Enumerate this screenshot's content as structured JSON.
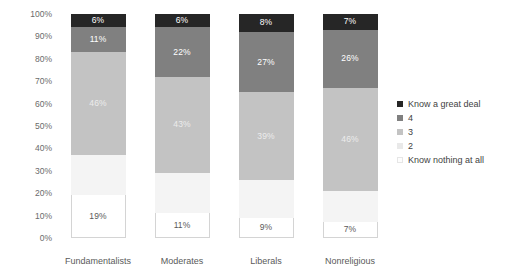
{
  "chart_data": {
    "type": "bar",
    "stacked": true,
    "stack_mode": "percent",
    "title": "",
    "subtitle": "",
    "xlabel": "",
    "ylabel": "",
    "ylim": [
      0,
      100
    ],
    "yticks": [
      "0%",
      "10%",
      "20%",
      "30%",
      "40%",
      "50%",
      "60%",
      "70%",
      "80%",
      "90%",
      "100%"
    ],
    "ytick_values": [
      0,
      10,
      20,
      30,
      40,
      50,
      60,
      70,
      80,
      90,
      100
    ],
    "grid": false,
    "legend_position": "right",
    "categories": [
      "Fundamentalists",
      "Moderates",
      "Liberals",
      "Nonreligious"
    ],
    "series": [
      {
        "name": "Know a great deal",
        "color": "#262626",
        "values": [
          6,
          6,
          8,
          7
        ],
        "labels": [
          "6%",
          "6%",
          "8%",
          "7%"
        ]
      },
      {
        "name": "4",
        "color": "#808080",
        "values": [
          11,
          22,
          27,
          26
        ],
        "labels": [
          "11%",
          "22%",
          "27%",
          "26%"
        ]
      },
      {
        "name": "3",
        "color": "#c3c3c3",
        "values": [
          46,
          43,
          39,
          46
        ],
        "labels": [
          "46%",
          "43%",
          "39%",
          "46%"
        ]
      },
      {
        "name": "2",
        "color": "#f4f4f4",
        "values": [
          18,
          18,
          17,
          14
        ],
        "labels": [
          "",
          "",
          "",
          ""
        ]
      },
      {
        "name": "Know nothing at all",
        "color": "#ffffff",
        "values": [
          19,
          11,
          9,
          7
        ],
        "labels": [
          "19%",
          "11%",
          "9%",
          "7%"
        ]
      }
    ],
    "legend_entries": [
      "Know a great deal",
      "4",
      "3",
      "2",
      "Know nothing at all"
    ]
  }
}
